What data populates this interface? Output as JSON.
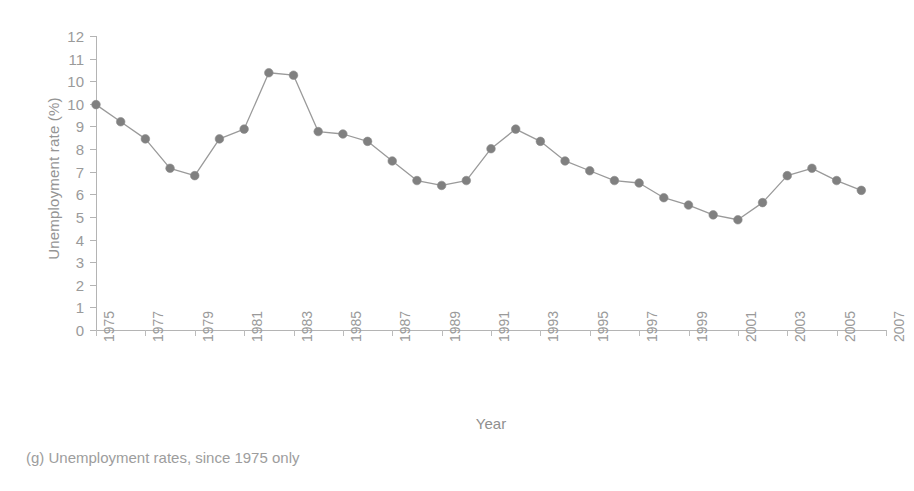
{
  "chart_data": {
    "type": "line",
    "title": "",
    "subtitle": "",
    "xlabel": "Year",
    "ylabel": "Unemployment rate (%)",
    "xlim": [
      1975,
      2007
    ],
    "ylim": [
      0,
      12
    ],
    "grid": false,
    "legend": null,
    "marker": "filled-circle",
    "series_color": "#808080",
    "line_color": "#9a9a9a",
    "ytick_labels": [
      "12",
      "11",
      "10",
      "10",
      "9",
      "8",
      "7",
      "6",
      "5",
      "4",
      "3",
      "2",
      "1",
      "0"
    ],
    "ytick_values": [
      12,
      11,
      10,
      9,
      8,
      7,
      6,
      5,
      4,
      3,
      2,
      1,
      0
    ],
    "xtick_labels": [
      "1975",
      "1977",
      "1979",
      "1981",
      "1983",
      "1985",
      "1987",
      "1989",
      "1991",
      "1993",
      "1995",
      "1997",
      "1999",
      "2001",
      "2003",
      "2005",
      "2007"
    ],
    "xtick_values": [
      1975,
      1977,
      1979,
      1981,
      1983,
      1985,
      1987,
      1989,
      1991,
      1993,
      1995,
      1997,
      1999,
      2001,
      2003,
      2005,
      2007
    ],
    "x": [
      1975,
      1976,
      1977,
      1978,
      1979,
      1980,
      1981,
      1982,
      1983,
      1984,
      1985,
      1986,
      1987,
      1988,
      1989,
      1990,
      1991,
      1992,
      1993,
      1994,
      1995,
      1996,
      1997,
      1998,
      1999,
      2000,
      2001,
      2002,
      2003,
      2004,
      2005,
      2006
    ],
    "values": [
      9.2,
      8.5,
      7.8,
      6.6,
      6.3,
      7.8,
      8.2,
      10.5,
      10.4,
      8.1,
      8.0,
      7.7,
      6.9,
      6.1,
      5.9,
      6.1,
      7.4,
      8.2,
      7.7,
      6.9,
      6.5,
      6.1,
      6.0,
      5.4,
      5.1,
      4.7,
      4.5,
      5.2,
      6.3,
      6.6,
      6.1,
      5.7
    ],
    "series": [
      {
        "name": "Unemployment rate",
        "values": [
          9.2,
          8.5,
          7.8,
          6.6,
          6.3,
          7.8,
          8.2,
          10.5,
          10.4,
          8.1,
          8.0,
          7.7,
          6.9,
          6.1,
          5.9,
          6.1,
          7.4,
          8.2,
          7.7,
          6.9,
          6.5,
          6.1,
          6.0,
          5.4,
          5.1,
          4.7,
          4.5,
          5.2,
          6.3,
          6.6,
          6.1,
          5.7
        ]
      }
    ],
    "points": [
      {
        "x": 1975,
        "y": 9.2
      },
      {
        "x": 1976,
        "y": 8.5
      },
      {
        "x": 1977,
        "y": 7.8
      },
      {
        "x": 1978,
        "y": 6.6
      },
      {
        "x": 1979,
        "y": 6.3
      },
      {
        "x": 1980,
        "y": 7.8
      },
      {
        "x": 1981,
        "y": 8.2
      },
      {
        "x": 1982,
        "y": 10.5
      },
      {
        "x": 1983,
        "y": 10.4
      },
      {
        "x": 1984,
        "y": 8.1
      },
      {
        "x": 1985,
        "y": 8.0
      },
      {
        "x": 1986,
        "y": 7.7
      },
      {
        "x": 1987,
        "y": 6.9
      },
      {
        "x": 1988,
        "y": 6.1
      },
      {
        "x": 1989,
        "y": 5.9
      },
      {
        "x": 1990,
        "y": 6.1
      },
      {
        "x": 1991,
        "y": 7.4
      },
      {
        "x": 1992,
        "y": 8.2
      },
      {
        "x": 1993,
        "y": 7.7
      },
      {
        "x": 1994,
        "y": 6.9
      },
      {
        "x": 1995,
        "y": 6.5
      },
      {
        "x": 1996,
        "y": 6.1
      },
      {
        "x": 1997,
        "y": 6.0
      },
      {
        "x": 1998,
        "y": 5.4
      },
      {
        "x": 1999,
        "y": 5.1
      },
      {
        "x": 2000,
        "y": 4.7
      },
      {
        "x": 2001,
        "y": 4.5
      },
      {
        "x": 2002,
        "y": 5.2
      },
      {
        "x": 2003,
        "y": 6.3
      },
      {
        "x": 2004,
        "y": 6.6
      },
      {
        "x": 2005,
        "y": 6.1
      },
      {
        "x": 2006,
        "y": 5.7
      }
    ]
  },
  "caption": {
    "text": "(g) Unemployment rates, since 1975 only"
  },
  "colors": {
    "marker": "#808080",
    "line": "#9a9a9a",
    "axis": "#b4b4b4",
    "text": "#9a9a9a",
    "background": "#ffffff"
  }
}
